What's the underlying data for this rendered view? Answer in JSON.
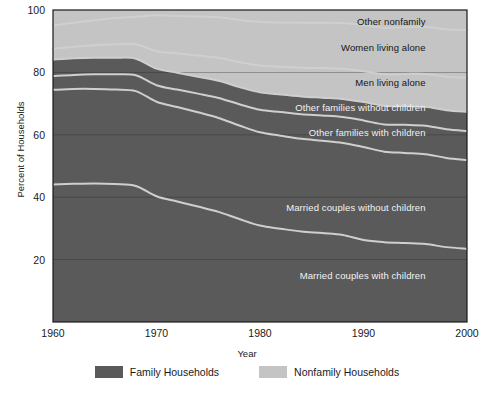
{
  "chart_data": {
    "type": "area",
    "title": "",
    "subtitle": "",
    "xlabel": "Year",
    "ylabel": "Percent of Households",
    "stacked": true,
    "stack_order": "bottom-to-top",
    "xlim": [
      1960,
      2000
    ],
    "ylim": [
      0,
      100
    ],
    "xticks": [
      1960,
      1970,
      1980,
      1990,
      2000
    ],
    "yticks": [
      20,
      40,
      60,
      80,
      100
    ],
    "xtick_labels": [
      "1960",
      "1970",
      "1980",
      "1990",
      "2000"
    ],
    "ytick_labels": [
      "20",
      "40",
      "60",
      "80",
      "100"
    ],
    "grid": true,
    "grid_axis": "y",
    "legend_position": "bottom",
    "x": [
      1960,
      1962,
      1964,
      1966,
      1968,
      1970,
      1972,
      1974,
      1976,
      1978,
      1980,
      1982,
      1984,
      1986,
      1988,
      1990,
      1992,
      1994,
      1996,
      1998,
      2000
    ],
    "series": [
      {
        "name": "Married couples with children",
        "group": "Family Households",
        "color": "#5a5a5a",
        "values": [
          44.1,
          44.3,
          44.4,
          44.2,
          43.6,
          40.3,
          38.6,
          37.0,
          35.3,
          33.0,
          30.9,
          29.9,
          29.0,
          28.5,
          27.9,
          26.3,
          25.6,
          25.3,
          25.0,
          24.0,
          23.5
        ]
      },
      {
        "name": "Married couples without children",
        "group": "Family Households",
        "color": "#5a5a5a",
        "values": [
          30.3,
          30.4,
          30.3,
          30.3,
          30.4,
          30.3,
          30.3,
          30.2,
          30.1,
          30.0,
          29.9,
          29.8,
          29.7,
          29.6,
          29.5,
          29.8,
          29.0,
          28.9,
          28.8,
          28.6,
          28.4
        ]
      },
      {
        "name": "Other families with children",
        "group": "Family Households",
        "color": "#5a5a5a",
        "values": [
          4.4,
          4.5,
          4.7,
          4.9,
          5.1,
          5.3,
          5.6,
          6.0,
          6.4,
          6.8,
          7.2,
          7.6,
          7.9,
          8.1,
          8.3,
          8.5,
          8.7,
          9.0,
          9.1,
          9.2,
          9.3
        ]
      },
      {
        "name": "Other families without children",
        "group": "Family Households",
        "color": "#5a5a5a",
        "values": [
          5.3,
          5.3,
          5.3,
          5.3,
          5.3,
          5.3,
          5.4,
          5.4,
          5.5,
          5.5,
          5.6,
          5.6,
          5.7,
          5.7,
          5.8,
          5.9,
          6.0,
          6.0,
          6.1,
          6.1,
          6.2
        ]
      },
      {
        "name": "Men living alone",
        "group": "Nonfamily Households",
        "color": "#c4c4c4",
        "values": [
          3.5,
          3.7,
          4.0,
          4.3,
          4.6,
          5.6,
          6.2,
          6.8,
          7.4,
          8.0,
          8.6,
          8.9,
          9.2,
          9.5,
          9.7,
          9.9,
          10.1,
          10.3,
          10.5,
          10.7,
          10.9
        ]
      },
      {
        "name": "Women living alone",
        "group": "Nonfamily Households",
        "color": "#c4c4c4",
        "values": [
          7.4,
          7.7,
          8.0,
          8.4,
          8.8,
          11.5,
          12.0,
          12.5,
          13.0,
          13.5,
          14.0,
          14.2,
          14.4,
          14.5,
          14.6,
          14.8,
          14.9,
          15.0,
          15.1,
          15.2,
          15.3
        ]
      },
      {
        "name": "Other nonfamily",
        "group": "Nonfamily Households",
        "color": "#c4c4c4",
        "values": [
          2.0,
          2.1,
          2.3,
          2.6,
          2.8,
          3.2,
          3.4,
          3.6,
          3.8,
          4.0,
          4.2,
          4.3,
          4.4,
          4.5,
          4.6,
          4.8,
          4.9,
          5.0,
          5.1,
          5.2,
          5.4
        ]
      }
    ],
    "inline_labels": [
      {
        "text": "Other nonfamily",
        "x": 1996,
        "y": 96.5,
        "style": "dark",
        "anchor": "end"
      },
      {
        "text": "Women living alone",
        "x": 1996,
        "y": 88.0,
        "style": "dark",
        "anchor": "end"
      },
      {
        "text": "Men living alone",
        "x": 1996,
        "y": 77.0,
        "style": "dark",
        "anchor": "end"
      },
      {
        "text": "Other families without children",
        "x": 1996,
        "y": 69.0,
        "style": "light",
        "anchor": "end"
      },
      {
        "text": "Other families with children",
        "x": 1996,
        "y": 61.0,
        "style": "light",
        "anchor": "end"
      },
      {
        "text": "Married couples without children",
        "x": 1996,
        "y": 37.0,
        "style": "light",
        "anchor": "end"
      },
      {
        "text": "Married couples with children",
        "x": 1996,
        "y": 15.0,
        "style": "light",
        "anchor": "end"
      }
    ]
  },
  "legend": {
    "items": [
      {
        "label": "Family Households",
        "color": "#5a5a5a"
      },
      {
        "label": "Nonfamily Households",
        "color": "#c4c4c4"
      }
    ]
  },
  "colors": {
    "family": "#5a5a5a",
    "nonfamily": "#c4c4c4",
    "boundary": "#cfcfcf",
    "axis": "#1a1a1a",
    "grid": "#2b2b2b",
    "background": "#ffffff"
  }
}
